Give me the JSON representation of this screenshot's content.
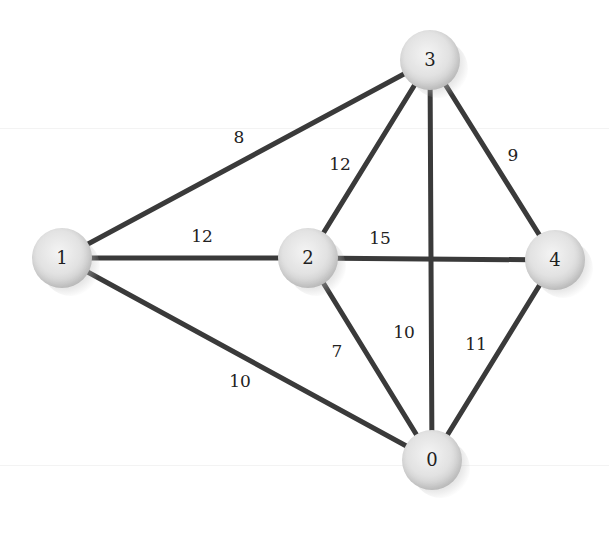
{
  "diagram": {
    "type": "weighted-undirected-graph",
    "style": {
      "edge_color": "#3a3a3a",
      "edge_width": 5,
      "node_fill": "#e2e2e2",
      "label_color": "#222222",
      "background": "#ffffff"
    },
    "nodes": [
      {
        "id": "0",
        "label": "0",
        "x": 432,
        "y": 460
      },
      {
        "id": "1",
        "label": "1",
        "x": 62,
        "y": 258
      },
      {
        "id": "2",
        "label": "2",
        "x": 308,
        "y": 258
      },
      {
        "id": "3",
        "label": "3",
        "x": 430,
        "y": 60
      },
      {
        "id": "4",
        "label": "4",
        "x": 555,
        "y": 260
      }
    ],
    "edges": [
      {
        "from": "1",
        "to": "3",
        "weight": "8",
        "label_x": 239,
        "label_y": 137
      },
      {
        "from": "1",
        "to": "2",
        "weight": "12",
        "label_x": 202,
        "label_y": 236
      },
      {
        "from": "1",
        "to": "0",
        "weight": "10",
        "label_x": 240,
        "label_y": 381
      },
      {
        "from": "2",
        "to": "3",
        "weight": "12",
        "label_x": 340,
        "label_y": 164
      },
      {
        "from": "2",
        "to": "4",
        "weight": "15",
        "label_x": 380,
        "label_y": 238
      },
      {
        "from": "2",
        "to": "0",
        "weight": "7",
        "label_x": 337,
        "label_y": 351
      },
      {
        "from": "3",
        "to": "0",
        "weight": "10",
        "label_x": 404,
        "label_y": 332
      },
      {
        "from": "3",
        "to": "4",
        "weight": "9",
        "label_x": 513,
        "label_y": 155
      },
      {
        "from": "4",
        "to": "0",
        "weight": "11",
        "label_x": 476,
        "label_y": 344
      }
    ]
  }
}
